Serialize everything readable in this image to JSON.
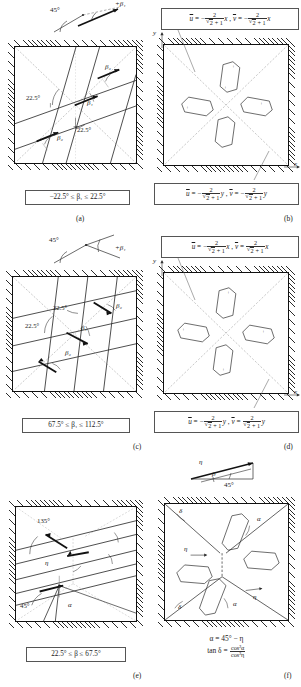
{
  "figure": {
    "type": "slip-line-field-diagram-grid",
    "rows": 3,
    "cols": 2,
    "panel_labels": [
      "(a)",
      "(b)",
      "(c)",
      "(d)",
      "(e)",
      "(f)"
    ]
  },
  "panel_a": {
    "label": "(a)",
    "top_sketch": {
      "angle_label": "45°",
      "beta_label": "+β₁"
    },
    "interior_labels": {
      "angle_left": "22.5°",
      "angle_bottom": "22.5°",
      "beta1": "β₁",
      "beta2_upper": "β₂",
      "beta2_lower": "β₂"
    },
    "caption_box": "−22.5° ≤ β₁ ≤ 22.5°"
  },
  "panel_b": {
    "label": "(b)",
    "axis_x": "x",
    "axis_y": "y",
    "top_formula": {
      "u_sign": "−",
      "u_num": "2",
      "u_den_root": "2",
      "u_den_add": "+ 1",
      "u_var": "x",
      "v_sign": "−",
      "v_num": "2",
      "v_den_root": "2",
      "v_den_add": "+ 1",
      "v_var": "x"
    },
    "bottom_formula": {
      "u_sign": "−",
      "u_num": "2",
      "u_den_root": "2",
      "u_den_add": "+ 1",
      "u_var": "y",
      "v_sign": "−",
      "v_num": "2",
      "v_den_root": "2",
      "v_den_add": "+ 1",
      "v_var": "y"
    },
    "hexagon_marks": [
      "+",
      "+",
      "+",
      "+"
    ]
  },
  "panel_c": {
    "label": "(c)",
    "top_sketch": {
      "angle_label": "45°",
      "beta_label": "+β₁"
    },
    "interior_labels": {
      "angle_upper": "22.5°",
      "angle_left": "22.5°",
      "beta1": "β₁",
      "beta2_upper": "β₂",
      "beta2_lower": "β₂"
    },
    "caption_box": "67.5° ≤ β₁ ≤ 112.5°"
  },
  "panel_d": {
    "label": "(d)",
    "axis_x": "x",
    "axis_y": "y",
    "top_formula": {
      "u_sign": "−",
      "u_num": "2",
      "u_den_root": "2",
      "u_den_add": "+ 1",
      "u_var": "x",
      "v_sign": "",
      "v_num": "2",
      "v_den_root": "2",
      "v_den_add": "+ 1",
      "v_var": "x"
    },
    "bottom_formula": {
      "u_sign": "−",
      "u_num": "2",
      "u_den_root": "2",
      "u_den_add": "+ 1",
      "u_var": "y",
      "v_sign": "",
      "v_num": "2",
      "v_den_root": "2",
      "v_den_add": "+ 1",
      "v_var": "y"
    },
    "hexagon_marks": [
      "+",
      "+",
      "+",
      "+"
    ]
  },
  "panel_e": {
    "label": "(e)",
    "interior_labels": {
      "angle_top": "135°",
      "angle_bottom": "45°",
      "eta": "η",
      "alpha": "α"
    },
    "caption_box": "22.5° ≤ β ≤ 67.5°"
  },
  "panel_f": {
    "label": "(f)",
    "top_sketch": {
      "eta_label": "η",
      "beta_label": "β",
      "angle_label": "45°"
    },
    "interior_labels": {
      "delta_top": "δ",
      "delta_bottom": "δ",
      "alpha_top": "α",
      "alpha_bottom": "α",
      "eta_left": "η",
      "eta_right": "η"
    },
    "formula_line1": "α = 45° − η",
    "formula_line2_lhs": "tan δ =",
    "formula_line2_num": "cos²α",
    "formula_line2_den": "cos²η"
  },
  "colors": {
    "ink": "#1a1a1a",
    "frame": "#111111",
    "hatch": "#2b2b2b",
    "thin_line": "#3a3a3a",
    "dotted": "#8a8a8a",
    "box_border": "#555555",
    "paper": "#ffffff"
  }
}
